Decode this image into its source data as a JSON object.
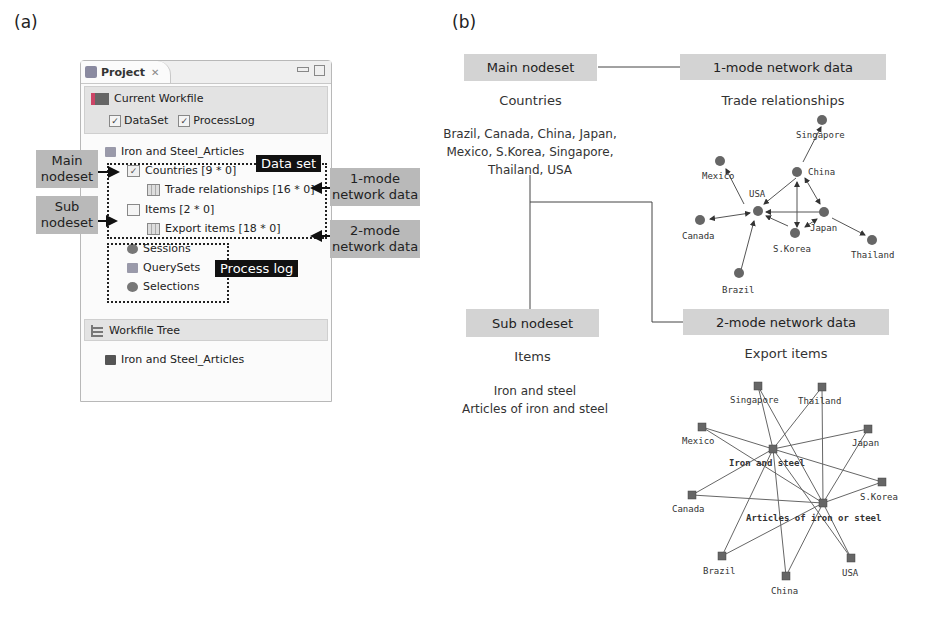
{
  "panel_a": {
    "label": "(a)",
    "window": {
      "tab_title": "Project",
      "current_workfile": {
        "title": "Current Workfile",
        "checkboxes": [
          {
            "label": "DataSet",
            "checked": true
          },
          {
            "label": "ProcessLog",
            "checked": true
          }
        ]
      },
      "tree": {
        "root": "Iron and Steel_Articles",
        "items": [
          {
            "label": "Countries [9 * 0]",
            "icon": "checked-nodeset-icon"
          },
          {
            "label": "Trade relationships [16 * 0]",
            "icon": "table-icon"
          },
          {
            "label": "Items [2 * 0]",
            "icon": "nodeset-icon"
          },
          {
            "label": "Export items [18 * 0]",
            "icon": "table-icon"
          },
          {
            "label": "Sessions",
            "icon": "sessions-icon"
          },
          {
            "label": "QuerySets",
            "icon": "querysets-icon"
          },
          {
            "label": "Selections",
            "icon": "selections-icon"
          }
        ]
      },
      "workfile_tree": {
        "title": "Workfile Tree",
        "item": "Iron and Steel_Articles"
      }
    },
    "annotations": {
      "data_set": "Data set",
      "process_log": "Process log",
      "main_nodeset_line1": "Main",
      "main_nodeset_line2": "nodeset",
      "sub_nodeset_line1": "Sub",
      "sub_nodeset_line2": "nodeset",
      "one_mode_line1": "1-mode",
      "one_mode_line2": "network data",
      "two_mode_line1": "2-mode",
      "two_mode_line2": "network data"
    }
  },
  "panel_b": {
    "label": "(b)",
    "main_nodeset": {
      "box": "Main nodeset",
      "title": "Countries",
      "list_line1": "Brazil, Canada, China, Japan,",
      "list_line2": "Mexico, S.Korea, Singapore,",
      "list_line3": "Thailand, USA"
    },
    "sub_nodeset": {
      "box": "Sub nodeset",
      "title": "Items",
      "list_line1": "Iron and steel",
      "list_line2": "Articles of iron and steel"
    },
    "one_mode": {
      "box": "1-mode network data",
      "title": "Trade relationships",
      "nodes": [
        "Singapore",
        "Mexico",
        "China",
        "USA",
        "Canada",
        "Japan",
        "S.Korea",
        "Thailand",
        "Brazil"
      ]
    },
    "two_mode": {
      "box": "2-mode network data",
      "title": "Export items",
      "nodes": [
        "Singapore",
        "Thailand",
        "Mexico",
        "Japan",
        "Iron and steel",
        "Canada",
        "S.Korea",
        "Articles of iron or steel",
        "Brazil",
        "USA",
        "China"
      ]
    }
  }
}
